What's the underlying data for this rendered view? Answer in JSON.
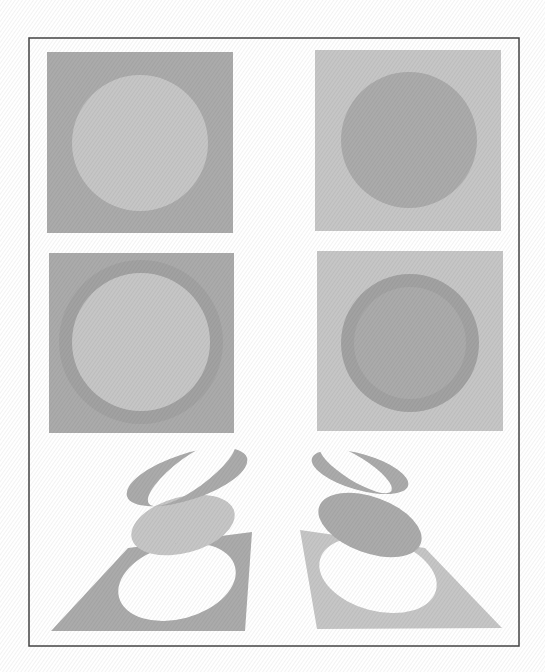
{
  "figure": {
    "colors": {
      "background": "#ffffff",
      "frame": "#444444",
      "dark_gray": "#ababab",
      "light_gray": "#c6c6c6",
      "ring_dark": "#a2a2a2",
      "hole": "#ffffff"
    },
    "frame": {
      "x": 29,
      "y": 38,
      "width": 490,
      "height": 608
    },
    "panels": [
      {
        "id": "top-left",
        "square": {
          "x": 47,
          "y": 52,
          "w": 186,
          "h": 181,
          "fill": "dark_gray"
        },
        "circle": {
          "cx": 140,
          "cy": 143,
          "r": 68,
          "fill": "light_gray"
        }
      },
      {
        "id": "top-right",
        "square": {
          "x": 315,
          "y": 50,
          "w": 186,
          "h": 181,
          "fill": "light_gray"
        },
        "circle": {
          "cx": 409,
          "cy": 140,
          "r": 68,
          "fill": "dark_gray"
        }
      },
      {
        "id": "middle-left",
        "square": {
          "x": 49,
          "y": 253,
          "w": 185,
          "h": 180,
          "fill": "dark_gray"
        },
        "ring": {
          "cx": 141,
          "cy": 342,
          "r_outer": 82,
          "r_inner": 69,
          "fill": "ring_dark"
        },
        "circle": {
          "cx": 141,
          "cy": 342,
          "r": 69,
          "fill": "light_gray"
        }
      },
      {
        "id": "middle-right",
        "square": {
          "x": 317,
          "y": 251,
          "w": 186,
          "h": 180,
          "fill": "light_gray"
        },
        "ring": {
          "cx": 410,
          "cy": 343,
          "r_outer": 69,
          "r_inner": 56,
          "fill": "ring_dark"
        },
        "circle": {
          "cx": 410,
          "cy": 343,
          "r": 56,
          "fill": "dark_gray"
        }
      }
    ],
    "perspective": {
      "left": {
        "plane": {
          "points": "128,548 252,532 245,631 51,631",
          "fill": "dark_gray",
          "hole": {
            "cx": 177,
            "cy": 582,
            "rx": 60,
            "ry": 37,
            "rot": -15
          }
        },
        "disk": {
          "cx": 183,
          "cy": 525,
          "rx": 53,
          "ry": 28,
          "rot": -15,
          "fill": "light_gray"
        },
        "ring": {
          "cx": 187,
          "cy": 477,
          "rx": 63,
          "ry": 23,
          "rot": -18,
          "fill": "dark_gray",
          "hole": {
            "cx": 193,
            "cy": 474,
            "rx": 53,
            "ry": 16,
            "rot": -18
          }
        }
      },
      "right": {
        "plane": {
          "points": "300,530 425,548 502,628 317,629",
          "fill": "light_gray",
          "hole": {
            "cx": 378,
            "cy": 575,
            "rx": 60,
            "ry": 36,
            "rot": 15
          }
        },
        "disk": {
          "cx": 370,
          "cy": 525,
          "rx": 54,
          "ry": 28,
          "rot": 20,
          "fill": "dark_gray"
        },
        "ring": {
          "cx": 360,
          "cy": 472,
          "rx": 50,
          "ry": 18,
          "rot": 16,
          "fill": "dark_gray",
          "hole": {
            "cx": 355,
            "cy": 470,
            "rx": 42,
            "ry": 12,
            "rot": 16
          }
        }
      }
    }
  }
}
